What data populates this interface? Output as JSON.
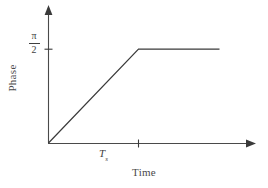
{
  "figure": {
    "background_color": "#ffffff",
    "line_color": "#3a3a3a",
    "axis_color": "#4a4a4a"
  },
  "axes": {
    "y": {
      "title": "Phase",
      "title_orientation": "vertical-ccw",
      "ticks": [
        {
          "name": "pi-over-two",
          "numerator": "π",
          "denominator": "2",
          "display": "π/2"
        }
      ]
    },
    "x": {
      "title": "Time",
      "ticks": [
        {
          "name": "settling-time",
          "symbol": "T",
          "subscript": "s",
          "display": "Tₛ"
        }
      ]
    }
  },
  "chart_data": {
    "type": "line",
    "title": "",
    "subtitle": "",
    "xlabel": "Time",
    "ylabel": "Phase",
    "xlim": [
      0,
      2.3
    ],
    "ylim": [
      0,
      1.45
    ],
    "grid": false,
    "legend": null,
    "x_tick_labels": [
      "Tₛ"
    ],
    "x_tick_values": [
      1.0
    ],
    "y_tick_labels": [
      "π/2"
    ],
    "y_tick_values": [
      1.0
    ],
    "axis_arrows": {
      "x_end": true,
      "y_end": true
    },
    "series": [
      {
        "name": "phase-response",
        "description": "Linear ramp from origin to pi/2 at Ts, then constant at pi/2",
        "x": [
          0.0,
          1.0,
          1.9
        ],
        "y": [
          0.0,
          1.0,
          1.0
        ],
        "color": "#3a3a3a",
        "linewidth": 1.2
      }
    ],
    "annotations": [
      {
        "name": "knee-point",
        "x": 1.0,
        "y": 1.0,
        "label": "Ramp reaches π/2 at Tₛ"
      }
    ]
  }
}
